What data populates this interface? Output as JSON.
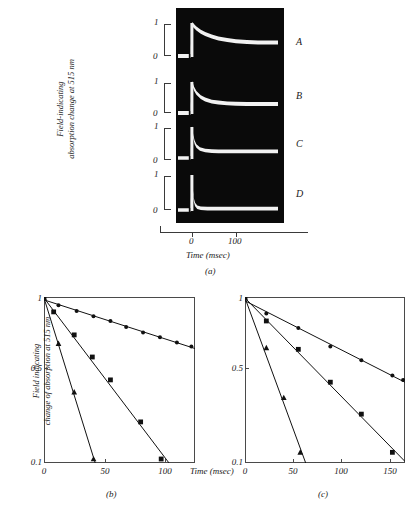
{
  "figure": {
    "panels": [
      "a",
      "b",
      "c"
    ]
  },
  "panel_a": {
    "caption": "(a)",
    "ylabel_line1": "Field-indicating",
    "ylabel_line2": "absorption change at 515 nm",
    "xlabel": "Time (msec)",
    "xticks": [
      {
        "value": 0,
        "label": "0"
      },
      {
        "value": 100,
        "label": "100"
      }
    ],
    "scale_top_label": "1",
    "scale_bottom_label": "0",
    "traces": [
      {
        "name": "A",
        "label": "A"
      },
      {
        "name": "B",
        "label": "B"
      },
      {
        "name": "C",
        "label": "C"
      },
      {
        "name": "D",
        "label": "D"
      }
    ]
  },
  "chart_data": [
    {
      "panel": "a",
      "type": "line",
      "title": "",
      "xlabel": "Time (msec)",
      "ylabel": "Field-indicating absorption change at 515 nm",
      "xlim": [
        -30,
        160
      ],
      "ylim": [
        0,
        1
      ],
      "grid": false,
      "legend": "right",
      "note": "Oscilloscope traces; white signal on black background. Each trace rises to 1 at t=0 then decays to a plateau.",
      "series": [
        {
          "name": "A",
          "plateau": 0.42,
          "x": [
            0,
            5,
            10,
            20,
            30,
            45,
            60,
            80,
            100,
            125,
            150
          ],
          "values": [
            1.0,
            0.93,
            0.86,
            0.76,
            0.69,
            0.61,
            0.55,
            0.5,
            0.46,
            0.44,
            0.42
          ]
        },
        {
          "name": "B",
          "plateau": 0.3,
          "x": [
            0,
            5,
            10,
            20,
            30,
            45,
            60,
            80,
            100,
            125,
            150
          ],
          "values": [
            1.0,
            0.8,
            0.67,
            0.53,
            0.45,
            0.38,
            0.35,
            0.32,
            0.31,
            0.3,
            0.3
          ]
        },
        {
          "name": "C",
          "plateau": 0.22,
          "x": [
            0,
            3,
            6,
            10,
            18,
            30,
            45,
            60,
            90,
            120,
            150
          ],
          "values": [
            1.0,
            0.7,
            0.52,
            0.4,
            0.3,
            0.25,
            0.23,
            0.22,
            0.22,
            0.22,
            0.22
          ]
        },
        {
          "name": "D",
          "plateau": 0.04,
          "x": [
            0,
            2,
            4,
            7,
            12,
            20,
            35,
            60,
            90,
            120,
            150
          ],
          "values": [
            1.0,
            0.55,
            0.3,
            0.16,
            0.08,
            0.05,
            0.04,
            0.04,
            0.04,
            0.04,
            0.04
          ]
        }
      ]
    },
    {
      "panel": "b",
      "type": "line",
      "title": "",
      "caption": "(b)",
      "xlabel": "Time (msec)",
      "ylabel": "Field indicating change of absorption at 515 nm",
      "xlim": [
        0,
        125
      ],
      "ylim": [
        0.1,
        1.0
      ],
      "yscale": "log",
      "grid": false,
      "xticks": [
        0,
        50,
        100
      ],
      "xticklabels": [
        "0",
        "50",
        "100"
      ],
      "yticks": [
        1.0,
        0.5,
        0.1
      ],
      "yticklabels": [
        "1",
        "0.5",
        "0.1"
      ],
      "series": [
        {
          "name": "circles",
          "marker": "circle",
          "x": [
            0,
            12,
            27,
            41,
            55,
            68,
            82,
            96,
            110,
            122
          ],
          "values": [
            1.0,
            0.9,
            0.83,
            0.77,
            0.72,
            0.66,
            0.61,
            0.57,
            0.53,
            0.5
          ]
        },
        {
          "name": "squares",
          "marker": "square",
          "x": [
            0,
            8,
            25,
            40,
            55,
            80,
            97
          ],
          "values": [
            1.0,
            0.82,
            0.59,
            0.43,
            0.31,
            0.17,
            0.1
          ]
        },
        {
          "name": "triangles",
          "marker": "triangle",
          "x": [
            0,
            12,
            25,
            41
          ],
          "values": [
            1.0,
            0.52,
            0.26,
            0.1
          ]
        }
      ]
    },
    {
      "panel": "c",
      "type": "line",
      "title": "",
      "caption": "(c)",
      "xlabel": "Time (msec)",
      "ylabel": "Field indicating change of absorption at 515 nm",
      "xlim": [
        0,
        165
      ],
      "ylim": [
        0.1,
        1.0
      ],
      "yscale": "log",
      "grid": false,
      "xticks": [
        0,
        50,
        100,
        150
      ],
      "xticklabels": [
        "0",
        "50",
        "100",
        "150"
      ],
      "yticks": [
        1.0,
        0.5,
        0.1
      ],
      "yticklabels": [
        "1",
        "0.5",
        "0.1"
      ],
      "series": [
        {
          "name": "circles",
          "marker": "circle",
          "x": [
            0,
            22,
            55,
            88,
            120,
            152,
            163
          ],
          "values": [
            1.0,
            0.8,
            0.65,
            0.5,
            0.41,
            0.33,
            0.31
          ]
        },
        {
          "name": "squares",
          "marker": "square",
          "x": [
            0,
            22,
            55,
            88,
            120,
            152
          ],
          "values": [
            1.0,
            0.72,
            0.48,
            0.3,
            0.19,
            0.11
          ]
        },
        {
          "name": "triangles",
          "marker": "triangle",
          "x": [
            0,
            22,
            40,
            57
          ],
          "values": [
            1.0,
            0.49,
            0.24,
            0.11
          ]
        }
      ]
    }
  ],
  "panel_b": {
    "caption": "(b)",
    "ylabel_line1": "Field indicating",
    "ylabel_line2": "change of absorption at 515 nm",
    "xlabel": "Time (msec)",
    "ytick_1": "1",
    "ytick_05": "0.5",
    "ytick_01": "0.1",
    "xtick_0": "0",
    "xtick_50": "50",
    "xtick_100": "100"
  },
  "panel_c": {
    "caption": "(c)",
    "xlabel": "Time (msec)",
    "ytick_1": "1",
    "ytick_05": "0.5",
    "ytick_01": "0.1",
    "xtick_0": "0",
    "xtick_50": "50",
    "xtick_100": "100",
    "xtick_150": "150"
  }
}
